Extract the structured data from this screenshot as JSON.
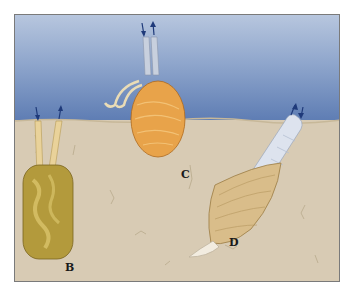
{
  "figure": {
    "labels": {
      "b": "B",
      "c": "C",
      "d": "D"
    },
    "colors": {
      "water_top": "#b7c6de",
      "water_bottom": "#5d7cb3",
      "sediment": "#d8cbb4",
      "clam_b": "#b39a3c",
      "clam_c": "#e8a34a",
      "clam_d": "#d9bd8a",
      "siphon_d": "#dde3ee",
      "arrow": "#1f3a7a"
    }
  }
}
